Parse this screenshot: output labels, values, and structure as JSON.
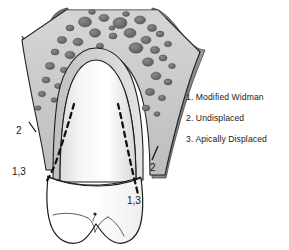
{
  "figure": {
    "background_color": "#ffffff"
  },
  "legend": {
    "items": [
      {
        "number": "1.",
        "label": "1. Modified Widman"
      },
      {
        "number": "2.",
        "label": "2. Undisplaced"
      },
      {
        "number": "3.",
        "label": "3. Apically Displaced"
      }
    ]
  },
  "callouts": [
    {
      "id": "left-undisplaced",
      "label": "2",
      "x": 16,
      "y": 131
    },
    {
      "id": "left-widman-apical",
      "label": "1,3",
      "x": 12,
      "y": 172
    },
    {
      "id": "right-undisplaced",
      "label": "2",
      "x": 150,
      "y": 168
    },
    {
      "id": "right-widman-apical",
      "label": "1,3",
      "x": 127,
      "y": 201
    }
  ],
  "anatomy": {
    "parts": [
      {
        "name": "alveolar-bone",
        "description": "trabecular spongy bone with marrow spaces",
        "color": "#c9c9c9"
      },
      {
        "name": "marrow-space",
        "description": "dark cavity within bone",
        "color": "#6e6e6e"
      },
      {
        "name": "gingiva-left",
        "description": "soft tissue flap left",
        "color": "#7d7d7d"
      },
      {
        "name": "gingiva-right",
        "description": "soft tissue flap right",
        "color": "#8a8a8a"
      },
      {
        "name": "periodontal-ligament",
        "description": "ligament space outlining root",
        "color": "#e8e8e8"
      },
      {
        "name": "tooth-root",
        "description": "root of tooth",
        "color": "#f4f4f4"
      },
      {
        "name": "tooth-crown",
        "description": "crown of tooth with cusps",
        "color": "#ffffff"
      },
      {
        "name": "incision-line",
        "description": "dashed internal bevel incision path",
        "color": "#1a1a1a"
      }
    ]
  },
  "colors": {
    "outline": "#1a1a1a",
    "bone_fill": "#c6c6c6",
    "marrow": "#707070",
    "gingiva_dark": "#7a7a7a",
    "gingiva_mid": "#909090",
    "root_light": "#f6f6f6",
    "text": "#1b1b1b"
  }
}
